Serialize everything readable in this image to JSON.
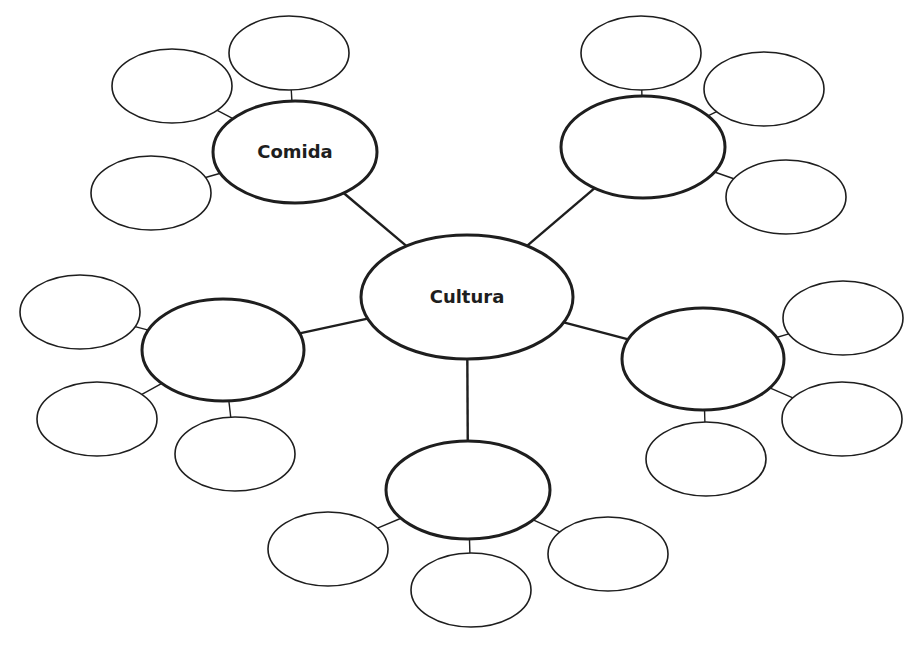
{
  "diagram": {
    "type": "mind-map",
    "center": {
      "label": "Cultura",
      "cx": 467,
      "cy": 297,
      "rx": 106,
      "ry": 62
    },
    "branches": [
      {
        "label": "Comida",
        "cx": 295,
        "cy": 152,
        "rx": 82,
        "ry": 51,
        "leaves": [
          {
            "label": "",
            "cx": 289,
            "cy": 53
          },
          {
            "label": "",
            "cx": 172,
            "cy": 86
          },
          {
            "label": "",
            "cx": 151,
            "cy": 193
          }
        ]
      },
      {
        "label": "",
        "cx": 643,
        "cy": 147,
        "rx": 82,
        "ry": 51,
        "leaves": [
          {
            "label": "",
            "cx": 641,
            "cy": 53
          },
          {
            "label": "",
            "cx": 764,
            "cy": 89
          },
          {
            "label": "",
            "cx": 786,
            "cy": 197
          }
        ]
      },
      {
        "label": "",
        "cx": 223,
        "cy": 350,
        "rx": 81,
        "ry": 51,
        "leaves": [
          {
            "label": "",
            "cx": 80,
            "cy": 312
          },
          {
            "label": "",
            "cx": 97,
            "cy": 419
          },
          {
            "label": "",
            "cx": 235,
            "cy": 454
          }
        ]
      },
      {
        "label": "",
        "cx": 703,
        "cy": 359,
        "rx": 81,
        "ry": 51,
        "leaves": [
          {
            "label": "",
            "cx": 843,
            "cy": 318
          },
          {
            "label": "",
            "cx": 842,
            "cy": 419
          },
          {
            "label": "",
            "cx": 706,
            "cy": 459
          }
        ]
      },
      {
        "label": "",
        "cx": 468,
        "cy": 490,
        "rx": 82,
        "ry": 49,
        "leaves": [
          {
            "label": "",
            "cx": 328,
            "cy": 549
          },
          {
            "label": "",
            "cx": 471,
            "cy": 590
          },
          {
            "label": "",
            "cx": 608,
            "cy": 554
          }
        ]
      }
    ]
  }
}
